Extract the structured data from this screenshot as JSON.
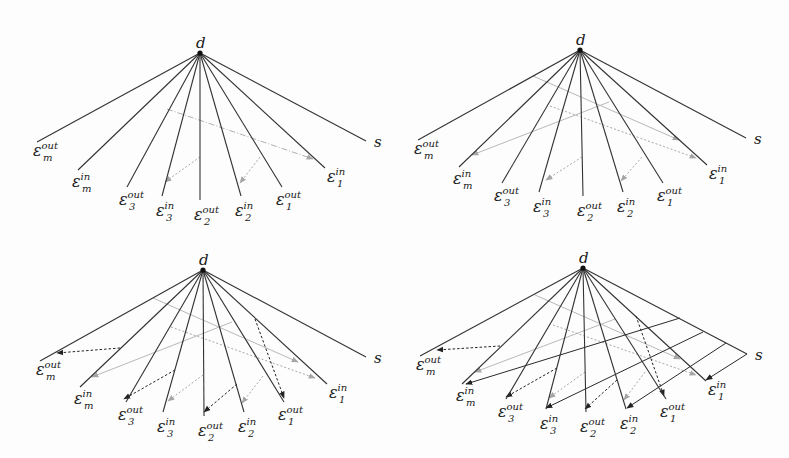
{
  "figure": {
    "colors": {
      "edge": "#333333",
      "grey_arrow": "#b5b5b5",
      "dotted_grey": "#a8a8a8",
      "black_dashed": "#222222"
    },
    "labels": {
      "center": "d",
      "s": "s",
      "leaves": [
        {
          "id": "em_out",
          "base": "ε",
          "sub": "m",
          "sup": "out"
        },
        {
          "id": "em_in",
          "base": "ε",
          "sub": "m",
          "sup": "in"
        },
        {
          "id": "e3_out",
          "base": "ε",
          "sub": "3",
          "sup": "out"
        },
        {
          "id": "e3_in",
          "base": "ε",
          "sub": "3",
          "sup": "in"
        },
        {
          "id": "e2_out",
          "base": "ε",
          "sub": "2",
          "sup": "out"
        },
        {
          "id": "e2_in",
          "base": "ε",
          "sub": "2",
          "sup": "in"
        },
        {
          "id": "e1_out",
          "base": "ε",
          "sub": "1",
          "sup": "out"
        },
        {
          "id": "e1_in",
          "base": "ε",
          "sub": "1",
          "sup": "in"
        },
        {
          "id": "s",
          "base": "s",
          "sub": "",
          "sup": ""
        }
      ]
    },
    "panels": [
      {
        "name": "panel-top-left",
        "apex": [
          200,
          53
        ],
        "ends": [
          [
            37,
            142
          ],
          [
            78,
            170
          ],
          [
            127,
            187
          ],
          [
            162,
            196
          ],
          [
            200,
            200
          ],
          [
            241,
            196
          ],
          [
            282,
            187
          ],
          [
            325,
            168
          ],
          [
            366,
            141
          ]
        ],
        "arrows": [
          {
            "style": "grey-dashdot",
            "from": [
              167,
              109
            ],
            "to": [
              313,
              159
            ]
          },
          {
            "style": "grey-dotted",
            "from": [
              200,
              157
            ],
            "to": [
              165,
              182
            ]
          },
          {
            "style": "grey-dotted",
            "from": [
              260,
              157
            ],
            "to": [
              240,
              183
            ]
          }
        ]
      },
      {
        "name": "panel-top-right",
        "apex": [
          580,
          50
        ],
        "ends": [
          [
            418,
            140
          ],
          [
            459,
            167
          ],
          [
            502,
            183
          ],
          [
            539,
            192
          ],
          [
            583,
            196
          ],
          [
            623,
            192
          ],
          [
            663,
            183
          ],
          [
            707,
            165
          ],
          [
            746,
            138
          ]
        ],
        "arrows": [
          {
            "style": "grey-solid",
            "from": [
              533,
              76
            ],
            "to": [
              679,
              140
            ]
          },
          {
            "style": "grey-solid",
            "from": [
              609,
              102
            ],
            "to": [
              472,
              155
            ]
          },
          {
            "style": "grey-dotted",
            "from": [
              550,
              106
            ],
            "to": [
              696,
              158
            ]
          },
          {
            "style": "grey-dotted",
            "from": [
              582,
              157
            ],
            "to": [
              546,
              180
            ]
          },
          {
            "style": "grey-dotted",
            "from": [
              642,
              157
            ],
            "to": [
              621,
              181
            ]
          }
        ]
      },
      {
        "name": "panel-bottom-left",
        "apex": [
          203,
          270
        ],
        "ends": [
          [
            40,
            361
          ],
          [
            80,
            387
          ],
          [
            126,
            402
          ],
          [
            163,
            412
          ],
          [
            204,
            416
          ],
          [
            244,
            412
          ],
          [
            284,
            402
          ],
          [
            327,
            384
          ],
          [
            366,
            357
          ]
        ],
        "arrows": [
          {
            "style": "grey-solid",
            "from": [
              153,
              298
            ],
            "to": [
              298,
              362
            ]
          },
          {
            "style": "grey-solid",
            "from": [
              232,
              322
            ],
            "to": [
              92,
              377
            ]
          },
          {
            "style": "grey-dotted",
            "from": [
              171,
              327
            ],
            "to": [
              315,
              378
            ]
          },
          {
            "style": "grey-dotted",
            "from": [
              203,
              375
            ],
            "to": [
              168,
              401
            ]
          },
          {
            "style": "grey-dotted",
            "from": [
              263,
              376
            ],
            "to": [
              242,
              403
            ]
          },
          {
            "style": "black-dashed",
            "from": [
              120,
              348
            ],
            "to": [
              57,
              353
            ]
          },
          {
            "style": "black-dashed",
            "from": [
              175,
              370
            ],
            "to": [
              124,
              399
            ]
          },
          {
            "style": "black-dashed",
            "from": [
              237,
              384
            ],
            "to": [
              204,
              412
            ]
          },
          {
            "style": "black-dashed",
            "from": [
              255,
              319
            ],
            "to": [
              284,
              398
            ]
          }
        ]
      },
      {
        "name": "panel-bottom-right",
        "apex": [
          583,
          268
        ],
        "ends": [
          [
            420,
            356
          ],
          [
            462,
            384
          ],
          [
            506,
            399
          ],
          [
            546,
            409
          ],
          [
            586,
            412
          ],
          [
            626,
            409
          ],
          [
            666,
            399
          ],
          [
            706,
            381
          ],
          [
            747,
            354
          ]
        ],
        "arrows": [
          {
            "style": "grey-solid",
            "from": [
              535,
              295
            ],
            "to": [
              680,
              359
            ]
          },
          {
            "style": "grey-solid",
            "from": [
              615,
              319
            ],
            "to": [
              475,
              372
            ]
          },
          {
            "style": "grey-dotted",
            "from": [
              553,
              325
            ],
            "to": [
              696,
              375
            ]
          },
          {
            "style": "grey-dotted",
            "from": [
              585,
              372
            ],
            "to": [
              549,
              398
            ]
          },
          {
            "style": "grey-dotted",
            "from": [
              645,
              372
            ],
            "to": [
              624,
              400
            ]
          },
          {
            "style": "black-dashed",
            "from": [
              500,
              346
            ],
            "to": [
              437,
              350
            ]
          },
          {
            "style": "black-dashed",
            "from": [
              557,
              368
            ],
            "to": [
              506,
              397
            ]
          },
          {
            "style": "black-dashed",
            "from": [
              617,
              380
            ],
            "to": [
              585,
              409
            ]
          },
          {
            "style": "black-dashed",
            "from": [
              636,
              316
            ],
            "to": [
              664,
              396
            ]
          },
          {
            "style": "black-solid",
            "from": [
              680,
              318
            ],
            "to": [
              466,
              384
            ]
          },
          {
            "style": "black-solid",
            "from": [
              703,
              332
            ],
            "to": [
              546,
              408
            ]
          },
          {
            "style": "black-solid",
            "from": [
              726,
              343
            ],
            "to": [
              627,
              408
            ]
          },
          {
            "style": "black-solid",
            "from": [
              747,
              354
            ],
            "to": [
              706,
              380
            ]
          }
        ]
      }
    ],
    "label_offsets": [
      [
        -4,
        14
      ],
      [
        -6,
        17
      ],
      [
        -8,
        18
      ],
      [
        -6,
        20
      ],
      [
        -6,
        20
      ],
      [
        -6,
        20
      ],
      [
        -6,
        18
      ],
      [
        2,
        14
      ],
      [
        8,
        6
      ]
    ]
  }
}
